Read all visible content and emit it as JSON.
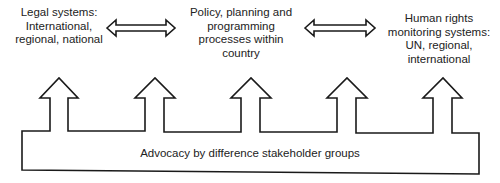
{
  "diagram": {
    "nodes": [
      {
        "id": "legal",
        "lines": [
          "Legal systems:",
          "International,",
          "regional, national"
        ]
      },
      {
        "id": "policy",
        "lines": [
          "Policy, planning and",
          "programming",
          "processes within",
          "country"
        ]
      },
      {
        "id": "human_rights",
        "lines": [
          "Human rights",
          "monitoring systems:",
          "UN, regional,",
          "international"
        ]
      }
    ],
    "connectors": [
      {
        "from": "legal",
        "to": "policy",
        "type": "double-headed-arrow"
      },
      {
        "from": "policy",
        "to": "human_rights",
        "type": "double-headed-arrow"
      }
    ],
    "base": {
      "label": "Advocacy by difference stakeholder groups",
      "upward_arrows": 5
    },
    "colors": {
      "stroke": "#1a1a1a",
      "text": "#222222",
      "background": "#ffffff"
    }
  }
}
